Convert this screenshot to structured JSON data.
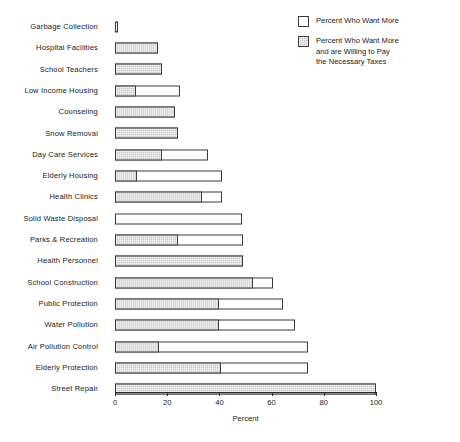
{
  "chart_data": {
    "type": "bar",
    "orientation": "horizontal",
    "stacked": true,
    "title": "",
    "xlabel": "Percent",
    "ylabel": "",
    "xlim": [
      0,
      100
    ],
    "xticks": [
      0,
      20,
      40,
      60,
      80,
      100
    ],
    "xtick_labels": [
      "0",
      "20",
      "40",
      "60",
      "80",
      "100"
    ],
    "grid": false,
    "legend_position": "top-right",
    "categories": [
      "Garbage Collection",
      "Hospital Facilities",
      "School Teachers",
      "Low Income Housing",
      "Counseling",
      "Snow Removal",
      "Day Care Services",
      "Elderly Housing",
      "Health Clinics",
      "Solid Waste Disposal",
      "Parks & Recreation",
      "Health Personnel",
      "School Construction",
      "Public Protection",
      "Water Pollution",
      "Air Pollution Control",
      "Elderly Protection",
      "Street Repair"
    ],
    "series": [
      {
        "name": "Percent Who Want More and are Willing to Pay the Necessary Taxes",
        "key": "willing_to_pay",
        "color": "#c8c8c8",
        "pattern": "stipple",
        "values": [
          0,
          16.5,
          18,
          8,
          23,
          24,
          18,
          8.5,
          33.5,
          0,
          24,
          49,
          53,
          40,
          40,
          17,
          40.5,
          100
        ]
      },
      {
        "name": "Percent Who Want More",
        "key": "want_more_total",
        "color": "#ffffff",
        "pattern": "open",
        "values": [
          1,
          16.5,
          18,
          25,
          23,
          24,
          35.5,
          41,
          41,
          48.5,
          49,
          49,
          60.5,
          64.5,
          69,
          74,
          74,
          100
        ]
      }
    ],
    "rows": [
      {
        "label": "Garbage Collection",
        "filled": 0,
        "total": 1
      },
      {
        "label": "Hospital Facilities",
        "filled": 16.5,
        "total": 16.5
      },
      {
        "label": "School Teachers",
        "filled": 18,
        "total": 18
      },
      {
        "label": "Low Income Housing",
        "filled": 8,
        "total": 25
      },
      {
        "label": "Counseling",
        "filled": 23,
        "total": 23
      },
      {
        "label": "Snow Removal",
        "filled": 24,
        "total": 24
      },
      {
        "label": "Day Care Services",
        "filled": 18,
        "total": 35.5
      },
      {
        "label": "Elderly Housing",
        "filled": 8.5,
        "total": 41
      },
      {
        "label": "Health Clinics",
        "filled": 33.5,
        "total": 41
      },
      {
        "label": "Solid Waste Disposal",
        "filled": 0,
        "total": 48.5
      },
      {
        "label": "Parks & Recreation",
        "filled": 24,
        "total": 49
      },
      {
        "label": "Health Personnel",
        "filled": 49,
        "total": 49
      },
      {
        "label": "School Construction",
        "filled": 53,
        "total": 60.5
      },
      {
        "label": "Public Protection",
        "filled": 40,
        "total": 64.5
      },
      {
        "label": "Water Pollution",
        "filled": 40,
        "total": 69
      },
      {
        "label": "Air Pollution Control",
        "filled": 17,
        "total": 74
      },
      {
        "label": "Elderly Protection",
        "filled": 40.5,
        "total": 74
      },
      {
        "label": "Street Repair",
        "filled": 100,
        "total": 100
      }
    ]
  },
  "legend": {
    "items": [
      {
        "swatch": "open",
        "label": "Percent Who Want More"
      },
      {
        "swatch": "filled",
        "label": "Percent Who Want More\nand are Willing to Pay\nthe Necessary Taxes"
      }
    ]
  },
  "axis": {
    "title": "Percent"
  }
}
